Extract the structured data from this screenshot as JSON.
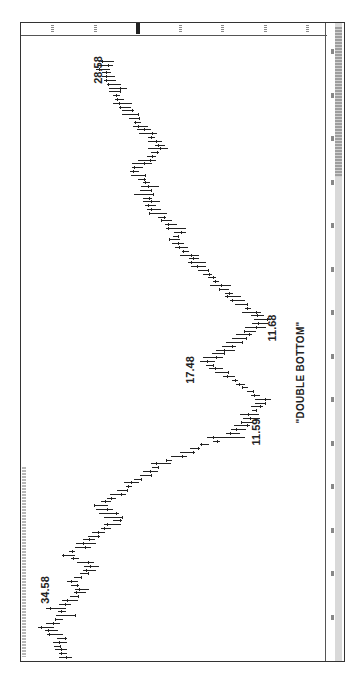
{
  "chart_data": {
    "type": "bar",
    "subtype": "ohlc",
    "orientation": "rotated-90-ccw",
    "title": "",
    "xlabel": "Time",
    "ylabel": "Price",
    "price_axis": {
      "position": "top (rotated right side)",
      "ticks_estimated": [
        34,
        29.5,
        25,
        20.5,
        16,
        11.5,
        7
      ],
      "current_price_marker": 25
    },
    "date_axis": {
      "position": "right (rotated bottom)",
      "tick_count": 14
    },
    "ylim": [
      6,
      36
    ],
    "grid": false,
    "annotations": [
      {
        "label": "34.58",
        "value": 34.58,
        "kind": "high"
      },
      {
        "label": "17.48",
        "value": 17.48,
        "kind": "reaction-high"
      },
      {
        "label": "11.59",
        "value": 11.59,
        "kind": "low"
      },
      {
        "label": "11.68",
        "value": 11.68,
        "kind": "low"
      },
      {
        "label": "\"DOUBLE BOTTOM\"",
        "kind": "pattern"
      },
      {
        "label": "28.58",
        "value": 28.58,
        "kind": "recent-high"
      }
    ],
    "series": [
      {
        "name": "price-midpoint (estimated)",
        "values": [
          32.5,
          32.8,
          33.0,
          33.4,
          33.1,
          32.9,
          33.6,
          34.0,
          34.58,
          33.8,
          33.2,
          32.5,
          32.9,
          33.5,
          32.6,
          32.0,
          31.6,
          31.0,
          30.8,
          31.5,
          31.8,
          31.2,
          30.5,
          30.0,
          29.8,
          30.4,
          31.5,
          32.2,
          31.8,
          30.7,
          30.3,
          30.0,
          29.5,
          29.0,
          28.2,
          27.5,
          27.0,
          27.4,
          27.9,
          28.4,
          28.8,
          28.2,
          27.6,
          27.0,
          26.5,
          25.8,
          25.5,
          24.9,
          24.0,
          23.5,
          23.0,
          22.4,
          21.6,
          20.5,
          19.6,
          18.8,
          17.8,
          16.5,
          15.5,
          14.8,
          14.2,
          13.8,
          13.3,
          12.8,
          13.0,
          12.5,
          12.2,
          11.9,
          11.59,
          12.4,
          12.9,
          13.5,
          14.0,
          14.6,
          15.2,
          15.9,
          16.6,
          17.2,
          17.48,
          16.9,
          16.3,
          15.6,
          15.2,
          14.6,
          14.1,
          13.6,
          13.0,
          12.4,
          11.9,
          11.68,
          12.2,
          12.8,
          13.2,
          13.9,
          14.3,
          14.8,
          15.2,
          15.7,
          16.1,
          16.6,
          17.0,
          17.5,
          17.9,
          18.4,
          18.6,
          18.9,
          19.4,
          19.8,
          20.2,
          20.6,
          21.0,
          20.8,
          20.4,
          20.8,
          21.3,
          21.8,
          22.3,
          22.7,
          23.1,
          23.5,
          23.4,
          23.8,
          24.2,
          24.0,
          23.6,
          23.9,
          24.4,
          24.8,
          25.2,
          24.9,
          24.4,
          23.9,
          23.4,
          23.0,
          22.7,
          22.5,
          23.0,
          23.4,
          23.8,
          24.2,
          24.6,
          24.9,
          25.2,
          25.6,
          25.9,
          26.2,
          26.5,
          26.8,
          27.1,
          27.3,
          27.0,
          27.4,
          27.8,
          28.0,
          28.2,
          28.58,
          28.3,
          28.1
        ]
      }
    ]
  }
}
